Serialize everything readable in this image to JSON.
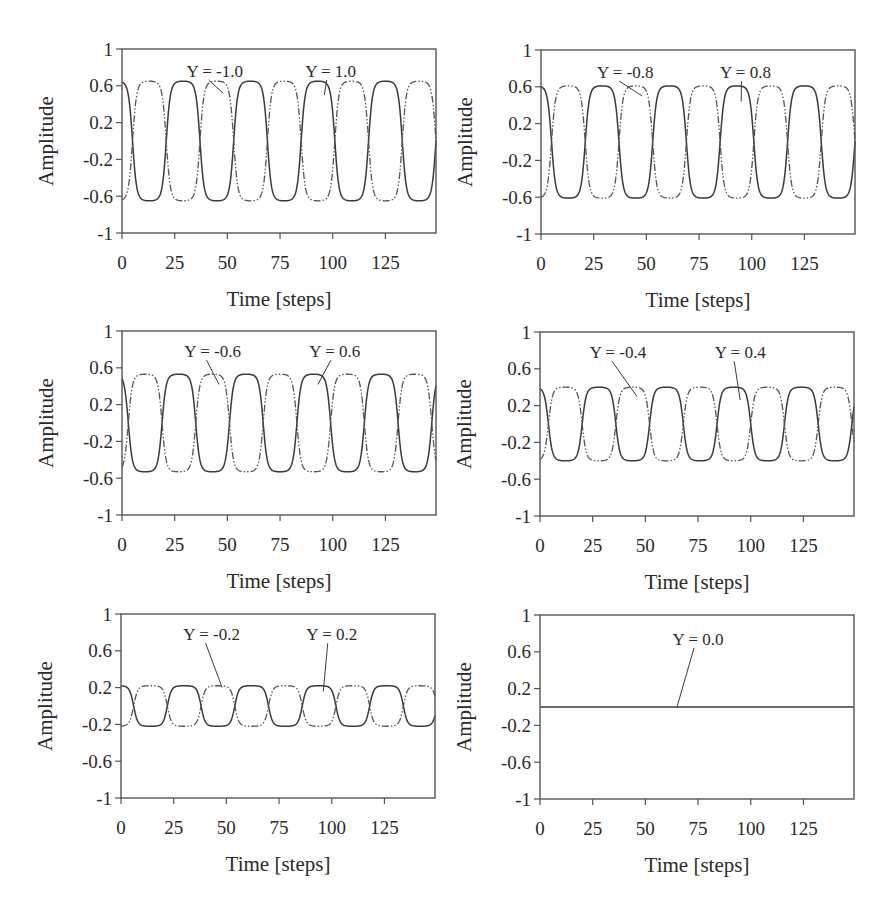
{
  "figure": {
    "panels": [
      {
        "id": "p1",
        "label_neg": "Y = -1.0",
        "label_pos": "Y = 1.0"
      },
      {
        "id": "p2",
        "label_neg": "Y = -0.8",
        "label_pos": "Y = 0.8"
      },
      {
        "id": "p3",
        "label_neg": "Y = -0.6",
        "label_pos": "Y = 0.6"
      },
      {
        "id": "p4",
        "label_neg": "Y = -0.4",
        "label_pos": "Y = 0.4"
      },
      {
        "id": "p5",
        "label_neg": "Y = -0.2",
        "label_pos": "Y = 0.2"
      },
      {
        "id": "p6",
        "label_single": "Y = 0.0"
      }
    ]
  },
  "chart_data": [
    {
      "type": "line",
      "title": "",
      "xlabel": "Time [steps]",
      "ylabel": "Amplitude",
      "xlim": [
        0,
        149
      ],
      "ylim": [
        -1,
        1
      ],
      "xticks": [
        0,
        25,
        50,
        75,
        100,
        125
      ],
      "yticks": [
        1,
        0.6,
        0.2,
        -0.2,
        -0.6,
        -1
      ],
      "ytick_labels": [
        "1",
        "0.6",
        "0.2",
        "-0.2",
        "-0.6",
        "-1"
      ],
      "grid": false,
      "series": [
        {
          "name": "Y = 1.0",
          "style": "solid",
          "amplitude": 0.65,
          "period": 32,
          "first_zero_crossing": 5,
          "start_value": 0.55,
          "direction_at_start": "falling"
        },
        {
          "name": "Y = -1.0",
          "style": "dash-dot",
          "amplitude": 0.65,
          "period": 32,
          "first_zero_crossing": 5,
          "start_value": -0.55,
          "direction_at_start": "rising"
        }
      ],
      "annotations": [
        {
          "text": "Y = -1.0",
          "text_xy": [
            44,
            0.76
          ],
          "arrow_to": [
            48,
            0.52
          ]
        },
        {
          "text": "Y = 1.0",
          "text_xy": [
            99,
            0.76
          ],
          "arrow_to": [
            96,
            0.5
          ]
        }
      ]
    },
    {
      "type": "line",
      "title": "",
      "xlabel": "Time [steps]",
      "ylabel": "Amplitude",
      "xlim": [
        0,
        149
      ],
      "ylim": [
        -1,
        1
      ],
      "xticks": [
        0,
        25,
        50,
        75,
        100,
        125
      ],
      "yticks": [
        1,
        0.6,
        0.2,
        -0.2,
        -0.6,
        -1
      ],
      "ytick_labels": [
        "1",
        "0.6",
        "0.2",
        "-0.2",
        "-0.6",
        "-1"
      ],
      "grid": false,
      "series": [
        {
          "name": "Y = 0.8",
          "style": "solid",
          "amplitude": 0.61,
          "period": 32,
          "first_zero_crossing": 5,
          "start_value": 0.52,
          "direction_at_start": "falling"
        },
        {
          "name": "Y = -0.8",
          "style": "dash-dot",
          "amplitude": 0.61,
          "period": 32,
          "first_zero_crossing": 5,
          "start_value": -0.52,
          "direction_at_start": "rising"
        }
      ],
      "annotations": [
        {
          "text": "Y = -0.8",
          "text_xy": [
            40,
            0.76
          ],
          "arrow_to": [
            48,
            0.5
          ]
        },
        {
          "text": "Y = 0.8",
          "text_xy": [
            97,
            0.76
          ],
          "arrow_to": [
            95,
            0.44
          ]
        }
      ]
    },
    {
      "type": "line",
      "title": "",
      "xlabel": "Time [steps]",
      "ylabel": "Amplitude",
      "xlim": [
        0,
        149
      ],
      "ylim": [
        -1,
        1
      ],
      "xticks": [
        0,
        25,
        50,
        75,
        100,
        125
      ],
      "yticks": [
        1,
        0.6,
        0.2,
        -0.2,
        -0.6,
        -1
      ],
      "ytick_labels": [
        "1",
        "0.6",
        "0.2",
        "-0.2",
        "-0.6",
        "-1"
      ],
      "grid": false,
      "series": [
        {
          "name": "Y = 0.6",
          "style": "solid",
          "amplitude": 0.53,
          "period": 32,
          "first_zero_crossing": 3,
          "start_value": 0.2,
          "direction_at_start": "falling"
        },
        {
          "name": "Y = -0.6",
          "style": "dash-dot",
          "amplitude": 0.53,
          "period": 32,
          "first_zero_crossing": 3,
          "start_value": -0.2,
          "direction_at_start": "rising"
        }
      ],
      "annotations": [
        {
          "text": "Y = -0.6",
          "text_xy": [
            43,
            0.78
          ],
          "arrow_to": [
            46,
            0.42
          ]
        },
        {
          "text": "Y = 0.6",
          "text_xy": [
            101,
            0.78
          ],
          "arrow_to": [
            93,
            0.42
          ]
        }
      ]
    },
    {
      "type": "line",
      "title": "",
      "xlabel": "Time [steps]",
      "ylabel": "Amplitude",
      "xlim": [
        0,
        149
      ],
      "ylim": [
        -1,
        1
      ],
      "xticks": [
        0,
        25,
        50,
        75,
        100,
        125
      ],
      "yticks": [
        1,
        0.6,
        0.2,
        -0.2,
        -0.6,
        -1
      ],
      "ytick_labels": [
        "1",
        "0.6",
        "0.2",
        "-0.2",
        "-0.6",
        "-1"
      ],
      "grid": false,
      "series": [
        {
          "name": "Y = 0.4",
          "style": "solid",
          "amplitude": 0.4,
          "period": 32,
          "first_zero_crossing": 4,
          "start_value": 0.2,
          "direction_at_start": "falling"
        },
        {
          "name": "Y = -0.4",
          "style": "dash-dot",
          "amplitude": 0.4,
          "period": 32,
          "first_zero_crossing": 4,
          "start_value": -0.2,
          "direction_at_start": "rising"
        }
      ],
      "annotations": [
        {
          "text": "Y = -0.4",
          "text_xy": [
            37,
            0.78
          ],
          "arrow_to": [
            46,
            0.3
          ]
        },
        {
          "text": "Y = 0.4",
          "text_xy": [
            95,
            0.78
          ],
          "arrow_to": [
            95,
            0.26
          ]
        }
      ]
    },
    {
      "type": "line",
      "title": "",
      "xlabel": "Time [steps]",
      "ylabel": "Amplitude",
      "xlim": [
        0,
        149
      ],
      "ylim": [
        -1,
        1
      ],
      "xticks": [
        0,
        25,
        50,
        75,
        100,
        125
      ],
      "yticks": [
        1,
        0.6,
        0.2,
        -0.2,
        -0.6,
        -1
      ],
      "ytick_labels": [
        "1",
        "0.6",
        "0.2",
        "-0.2",
        "-0.6",
        "-1"
      ],
      "grid": false,
      "series": [
        {
          "name": "Y = 0.2",
          "style": "solid",
          "amplitude": 0.22,
          "period": 32,
          "first_zero_crossing": 6,
          "start_value": 0.15,
          "direction_at_start": "falling"
        },
        {
          "name": "Y = -0.2",
          "style": "dash-dot",
          "amplitude": 0.22,
          "period": 32,
          "first_zero_crossing": 6,
          "start_value": -0.15,
          "direction_at_start": "rising"
        }
      ],
      "annotations": [
        {
          "text": "Y = -0.2",
          "text_xy": [
            43,
            0.78
          ],
          "arrow_to": [
            48,
            0.2
          ]
        },
        {
          "text": "Y = 0.2",
          "text_xy": [
            100,
            0.78
          ],
          "arrow_to": [
            96,
            0.16
          ]
        }
      ]
    },
    {
      "type": "line",
      "title": "",
      "xlabel": "Time [steps]",
      "ylabel": "Amplitude",
      "xlim": [
        0,
        149
      ],
      "ylim": [
        -1,
        1
      ],
      "xticks": [
        0,
        25,
        50,
        75,
        100,
        125
      ],
      "yticks": [
        1,
        0.6,
        0.2,
        -0.2,
        -0.6,
        -1
      ],
      "ytick_labels": [
        "1",
        "0.6",
        "0.2",
        "-0.2",
        "-0.6",
        "-1"
      ],
      "grid": false,
      "series": [
        {
          "name": "Y = 0.0",
          "style": "solid",
          "amplitude": 0.0,
          "period": 32,
          "first_zero_crossing": 0,
          "start_value": 0.0,
          "direction_at_start": "flat"
        }
      ],
      "annotations": [
        {
          "text": "Y = 0.0",
          "text_xy": [
            75,
            0.74
          ],
          "arrow_to": [
            65,
            0.0
          ]
        }
      ]
    }
  ]
}
